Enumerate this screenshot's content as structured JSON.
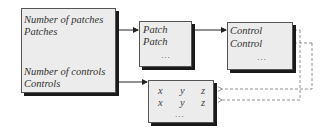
{
  "main_box": {
    "label_num_patches": "Number of patches",
    "label_patches": "Patches",
    "label_num_controls": "Number of controls",
    "label_controls": "Controls"
  },
  "patch_box": {
    "rows": [
      "Patch",
      "Patch"
    ],
    "ellipsis": "..."
  },
  "control_box": {
    "rows": [
      "Control",
      "Control"
    ],
    "ellipsis": "..."
  },
  "xyz_box": {
    "rows": [
      [
        "x",
        "y",
        "z"
      ],
      [
        "x",
        "y",
        "z"
      ]
    ],
    "ellipsis": "..."
  }
}
